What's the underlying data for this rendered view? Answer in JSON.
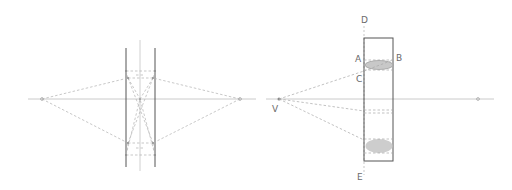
{
  "colors": {
    "background": "#ffffff",
    "axis": "#b8b8b8",
    "dashed": "#b0b0b0",
    "solid_dark": "#555555",
    "ellipse_fill": "#c8c8c8",
    "label": "#6a6a6a"
  },
  "left_diagram": {
    "description": "Lens ray construction with two focal points and parallel plates",
    "focal_points": [
      {
        "x": 42,
        "y": 99
      },
      {
        "x": 240,
        "y": 99
      }
    ]
  },
  "right_diagram": {
    "description": "Vanishing point construction for cylinder ellipses",
    "labels": {
      "D": "D",
      "E": "E",
      "A": "A",
      "B": "B",
      "C": "C",
      "V": "V"
    }
  }
}
